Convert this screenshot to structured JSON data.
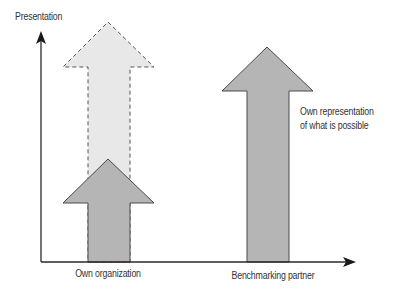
{
  "diagram": {
    "y_axis_label": "Presentation",
    "x_labels": [
      "Own organization",
      "Benchmarking partner"
    ],
    "annotation_line1": "Own representation",
    "annotation_line2": "of what is possible",
    "colors": {
      "axis": "#2a2a2a",
      "solid_arrow_fill": "#b3b3b3",
      "solid_arrow_stroke": "#4a4a4a",
      "dashed_arrow_fill": "#e6e6e6",
      "dashed_arrow_stroke": "#555555"
    },
    "arrows": [
      {
        "name": "own-organization-potential",
        "style": "dashed",
        "height": "high"
      },
      {
        "name": "own-organization-current",
        "style": "solid",
        "height": "low"
      },
      {
        "name": "benchmarking-partner",
        "style": "solid",
        "height": "high"
      }
    ]
  }
}
